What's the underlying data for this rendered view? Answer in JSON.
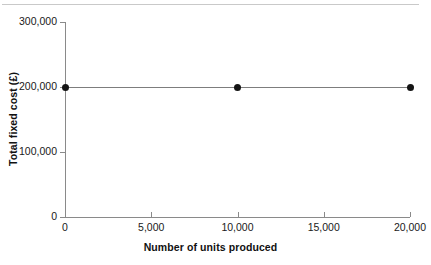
{
  "chart_data": {
    "type": "line",
    "title": "",
    "subtitle": "",
    "xlabel": "Number of units produced",
    "ylabel": "Total fixed cost (£)",
    "xlim": [
      0,
      20000
    ],
    "ylim": [
      0,
      300000
    ],
    "grid": false,
    "legend": null,
    "x_ticks": [
      {
        "value": 0,
        "label": "0"
      },
      {
        "value": 5000,
        "label": "5,000"
      },
      {
        "value": 10000,
        "label": "10,000"
      },
      {
        "value": 15000,
        "label": "15,000"
      },
      {
        "value": 20000,
        "label": "20,000"
      }
    ],
    "y_ticks": [
      {
        "value": 0,
        "label": "0"
      },
      {
        "value": 100000,
        "label": "100,000"
      },
      {
        "value": 200000,
        "label": "200,000"
      },
      {
        "value": 300000,
        "label": "300,000"
      }
    ],
    "series": [
      {
        "name": "Total fixed cost",
        "marker": "circle",
        "color": "#141414",
        "line_color": "#7d7d7d",
        "x": [
          0,
          10000,
          20000
        ],
        "values": [
          200000,
          200000,
          200000
        ]
      }
    ],
    "annotations": []
  },
  "colors": {
    "axis": "#8a8a8a",
    "marker": "#141414",
    "line": "#7d7d7d",
    "text": "#1a1a1a",
    "top_rule": "#c9c9c9",
    "background": "#ffffff"
  }
}
